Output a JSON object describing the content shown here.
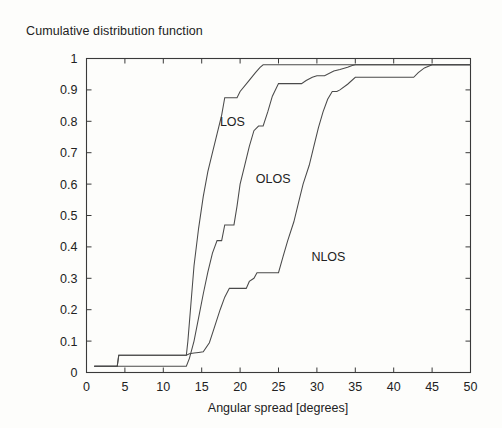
{
  "figure": {
    "title": "Cumulative distribution function",
    "background_color": "#fdfdfb",
    "line_color": "#4a4a4a",
    "axis_color": "#3a3a3a"
  },
  "chart_data": {
    "type": "line",
    "title": "Cumulative distribution function",
    "xlabel": "Angular spread [degrees]",
    "ylabel": "",
    "xlim": [
      0,
      50
    ],
    "ylim": [
      0,
      1
    ],
    "xticks": [
      0,
      5,
      10,
      15,
      20,
      25,
      30,
      35,
      40,
      45,
      50
    ],
    "xticklabels": [
      "0",
      "5",
      "10",
      "15",
      "20",
      "25",
      "30",
      "35",
      "40",
      "45",
      "50"
    ],
    "yticks": [
      0,
      0.1,
      0.2,
      0.3,
      0.4,
      0.5,
      0.6,
      0.7,
      0.8,
      0.9,
      1
    ],
    "yticklabels": [
      "0",
      "0.1",
      "0.2",
      "0.3",
      "0.4",
      "0.5",
      "0.6",
      "0.7",
      "0.8",
      "0.9",
      "1"
    ],
    "grid": false,
    "legend": "inline-annotations",
    "series": [
      {
        "name": "LOS",
        "label_x": 19.0,
        "label_y": 0.785,
        "x": [
          1.0,
          4.0,
          4.2,
          12.8,
          13.0,
          13.2,
          13.6,
          14.0,
          14.6,
          15.2,
          15.8,
          16.4,
          17.0,
          17.6,
          18.0,
          19.6,
          20.0,
          21.0,
          22.0,
          22.6,
          23.0,
          50.0
        ],
        "y": [
          0.02,
          0.02,
          0.055,
          0.055,
          0.055,
          0.1,
          0.22,
          0.34,
          0.46,
          0.56,
          0.64,
          0.7,
          0.76,
          0.82,
          0.875,
          0.875,
          0.895,
          0.925,
          0.955,
          0.972,
          0.98,
          0.98
        ]
      },
      {
        "name": "OLOS",
        "label_x": 24.3,
        "label_y": 0.605,
        "x": [
          1.0,
          13.0,
          13.4,
          14.0,
          14.6,
          15.2,
          15.8,
          16.4,
          17.0,
          17.6,
          18.0,
          19.2,
          19.6,
          20.0,
          20.6,
          21.2,
          21.8,
          22.4,
          23.0,
          23.6,
          24.2,
          25.0,
          28.0,
          28.6,
          29.4,
          30.0,
          31.0,
          32.2,
          33.0,
          34.0,
          34.6,
          35.0,
          50.0
        ],
        "y": [
          0.02,
          0.02,
          0.045,
          0.1,
          0.175,
          0.25,
          0.32,
          0.38,
          0.42,
          0.42,
          0.47,
          0.47,
          0.53,
          0.6,
          0.66,
          0.72,
          0.77,
          0.785,
          0.785,
          0.83,
          0.88,
          0.92,
          0.92,
          0.93,
          0.94,
          0.945,
          0.945,
          0.96,
          0.965,
          0.972,
          0.978,
          0.98,
          0.98
        ]
      },
      {
        "name": "NLOS",
        "label_x": 31.5,
        "label_y": 0.355,
        "x": [
          1.0,
          4.0,
          4.2,
          13.0,
          13.4,
          14.0,
          14.6,
          15.2,
          16.0,
          16.6,
          17.4,
          18.0,
          18.6,
          19.0,
          20.8,
          21.2,
          21.8,
          22.2,
          25.0,
          25.6,
          26.2,
          27.0,
          27.6,
          28.2,
          29.0,
          29.6,
          30.2,
          30.8,
          31.4,
          32.0,
          32.6,
          33.0,
          34.0,
          35.0,
          36.0,
          37.0,
          42.6,
          43.2,
          44.0,
          45.0,
          50.0
        ],
        "y": [
          0.02,
          0.02,
          0.055,
          0.055,
          0.06,
          0.062,
          0.064,
          0.066,
          0.095,
          0.14,
          0.2,
          0.24,
          0.268,
          0.268,
          0.268,
          0.29,
          0.3,
          0.318,
          0.318,
          0.37,
          0.42,
          0.48,
          0.54,
          0.6,
          0.66,
          0.72,
          0.78,
          0.83,
          0.87,
          0.895,
          0.895,
          0.9,
          0.918,
          0.94,
          0.94,
          0.94,
          0.94,
          0.955,
          0.97,
          0.98,
          0.98
        ]
      }
    ]
  }
}
